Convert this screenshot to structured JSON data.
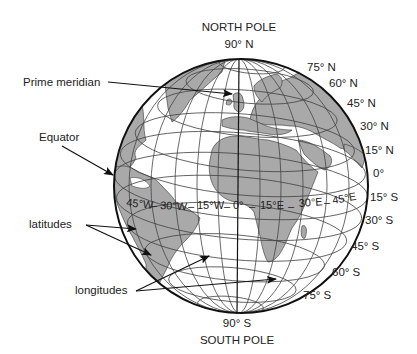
{
  "diagram": {
    "title_top": "NORTH POLE",
    "north_pole_value": "90° N",
    "south_pole_value": "90° S",
    "title_bottom": "SOUTH POLE",
    "callouts": {
      "prime_meridian": "Prime meridian",
      "equator": "Equator",
      "latitudes": "latitudes",
      "longitudes": "longitudes"
    },
    "latitude_labels": [
      "75° N",
      "60° N",
      "45° N",
      "30° N",
      "15° N",
      "0°",
      "15° S",
      "30° S",
      "45° S",
      "60° S",
      "75° S"
    ],
    "longitude_labels": [
      "45°W",
      "30°W",
      "15°W",
      "0°",
      "15°E",
      "30°E",
      "45°E"
    ],
    "colors": {
      "land": "#a9a9a9",
      "ocean": "#ffffff",
      "grid": "#444444",
      "outline": "#111111",
      "text": "#222222"
    }
  }
}
